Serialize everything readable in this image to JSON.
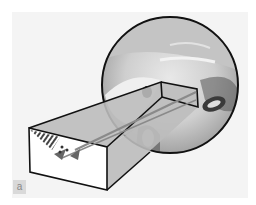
{
  "figure": {
    "panel_label": "a",
    "colors": {
      "background": "#f4f4f4",
      "outline": "#111111",
      "shaded_face": "#bdbdbd",
      "front_face": "#ffffff",
      "arrow": "#8a8a8a",
      "hatch": "#444444"
    },
    "elements": {
      "block": "3D rectangular block",
      "magnifier": "circular magnified inset",
      "arrow": "gray pointer arrow from block end to inset",
      "dots": "small marked points in block corner"
    }
  }
}
